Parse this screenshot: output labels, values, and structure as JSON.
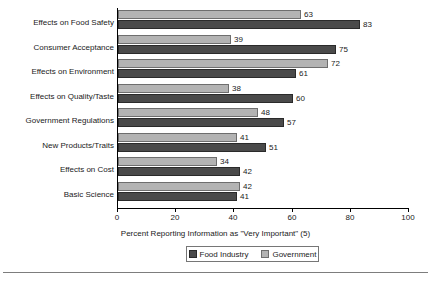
{
  "chart_data": {
    "type": "bar",
    "orientation": "horizontal",
    "title": "",
    "xlabel": "Percent Reporting Information as \"Very Important\" (5)",
    "ylabel": "",
    "xlim": [
      0,
      100
    ],
    "xticks": [
      0,
      20,
      40,
      60,
      80,
      100
    ],
    "grid": false,
    "legend_position": "bottom",
    "categories": [
      "Effects on Food Safety",
      "Consumer Acceptance",
      "Effects on Environment",
      "Effects on Quality/Taste",
      "Government Regulations",
      "New Products/Traits",
      "Effects on Cost",
      "Basic Science"
    ],
    "series": [
      {
        "name": "Food Industry",
        "color": "#4a4a4a",
        "values": [
          83,
          75,
          61,
          60,
          57,
          51,
          42,
          41
        ]
      },
      {
        "name": "Government",
        "color": "#b3b3b3",
        "values": [
          63,
          39,
          72,
          38,
          48,
          41,
          34,
          42
        ]
      }
    ]
  },
  "axis": {
    "tick_labels": [
      "0",
      "20",
      "40",
      "60",
      "80",
      "100"
    ],
    "title": "Percent Reporting Information as \"Very Important\" (5)"
  },
  "legend": {
    "items": [
      {
        "label": "Food Industry",
        "swatch": "dark-swatch"
      },
      {
        "label": "Government",
        "swatch": "light-swatch"
      }
    ]
  }
}
